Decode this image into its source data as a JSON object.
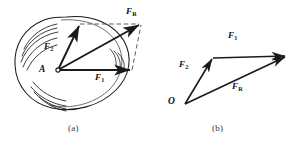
{
  "figure": {
    "background": "#ffffff",
    "stroke": "#1a1a1a",
    "dash_stroke": "#555555",
    "panels": [
      {
        "id": "a",
        "caption": "(a)",
        "description": "parallelogram law applied to a rock with two forces at point A",
        "origin_label": "A",
        "vectors": [
          {
            "name": "F2",
            "label_main": "F",
            "label_sub": "2",
            "from": [
              58,
              70
            ],
            "to": [
              79,
              25
            ]
          },
          {
            "name": "F1",
            "label_main": "F",
            "label_sub": "1",
            "from": [
              58,
              70
            ],
            "to": [
              131,
              70
            ]
          },
          {
            "name": "FR",
            "label_main": "F",
            "label_sub": "R",
            "from": [
              58,
              70
            ],
            "to": [
              140,
              25
            ]
          }
        ],
        "dashed_edges": [
          {
            "name": "f2-to-resultant",
            "from": [
              79,
              25
            ],
            "to": [
              140,
              25
            ]
          },
          {
            "name": "f1-to-resultant",
            "from": [
              131,
              70
            ],
            "to": [
              140,
              25
            ]
          }
        ]
      },
      {
        "id": "b",
        "caption": "(b)",
        "description": "triangle law head-to-tail construction from point O",
        "origin_label": "O",
        "vectors": [
          {
            "name": "F2",
            "label_main": "F",
            "label_sub": "2",
            "from": [
              185,
              104
            ],
            "to": [
              213,
              58
            ]
          },
          {
            "name": "F1",
            "label_main": "F",
            "label_sub": "1",
            "from": [
              213,
              58
            ],
            "to": [
              287,
              56
            ]
          },
          {
            "name": "FR",
            "label_main": "F",
            "label_sub": "R",
            "from": [
              185,
              104
            ],
            "to": [
              287,
              56
            ]
          }
        ],
        "dashed_edges": []
      }
    ]
  }
}
